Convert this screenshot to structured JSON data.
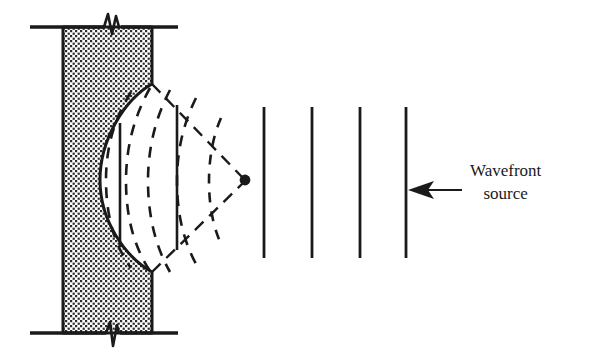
{
  "figure": {
    "background_color": "#ffffff",
    "ink_color": "#1a1a1a",
    "width": 589,
    "height": 363
  },
  "annotations": {
    "wavefront_source": {
      "line1": "Wavefront",
      "line2": "source",
      "x": 470,
      "y": 160
    }
  },
  "arrow": {
    "name": "wavefront-source-arrow",
    "from_x": 462,
    "to_x": 408,
    "y": 190,
    "direction": "left"
  },
  "block": {
    "name": "stippled-medium-block",
    "left": 63,
    "right": 152,
    "top": 27,
    "bottom": 333,
    "fill": "stipple",
    "stipple_color": "#2b2b2b"
  },
  "break_lines": {
    "top": {
      "y": 27,
      "x_start": 30,
      "x_end": 178,
      "break_x": 112
    },
    "bottom": {
      "y": 333,
      "x_start": 30,
      "x_end": 178,
      "break_x": 112
    }
  },
  "lens_surface": {
    "name": "convex-lens-surface",
    "top_x": 152,
    "top_y": 84,
    "apex_x": 100,
    "apex_y": 180,
    "bottom_x": 152,
    "bottom_y": 272
  },
  "focal_point": {
    "name": "focal-point",
    "x": 245,
    "y": 180,
    "radius": 5
  },
  "converging_rays": [
    {
      "x1": 152,
      "y1": 84,
      "x2": 245,
      "y2": 180
    },
    {
      "x1": 152,
      "y1": 272,
      "x2": 245,
      "y2": 180
    }
  ],
  "solid_wavefronts_in_lens": [
    {
      "x": 120,
      "y_top": 123,
      "y_bottom": 247
    },
    {
      "x": 177,
      "y_top": 105,
      "y_bottom": 250
    }
  ],
  "plane_wavefronts": [
    {
      "x": 264,
      "y_top": 107,
      "y_bottom": 258
    },
    {
      "x": 312,
      "y_top": 107,
      "y_bottom": 258
    },
    {
      "x": 360,
      "y_top": 107,
      "y_bottom": 258
    },
    {
      "x": 406,
      "y_top": 107,
      "y_bottom": 258
    }
  ],
  "curved_wavefronts": {
    "description": "dashed arcs converging toward focal point",
    "count": 5,
    "style": "dashed"
  }
}
